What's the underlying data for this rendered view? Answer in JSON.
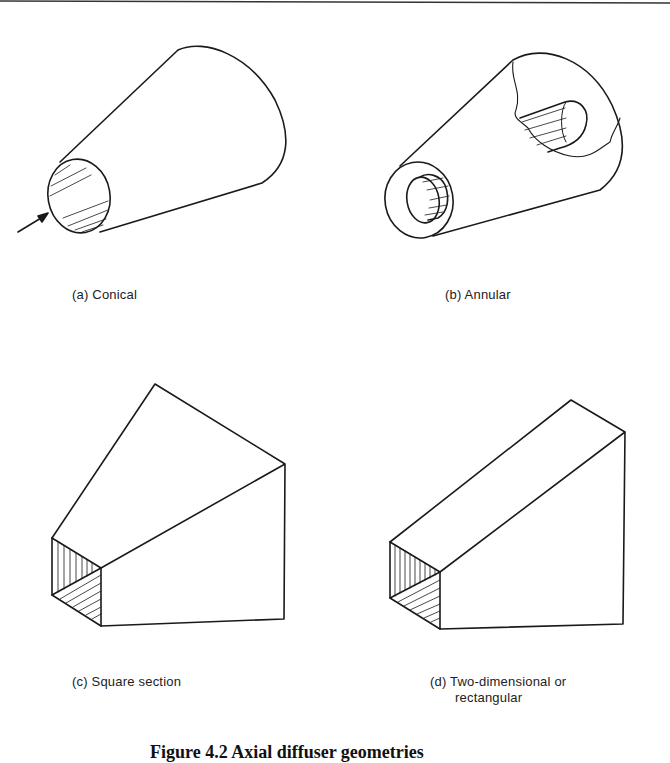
{
  "figure": {
    "panels": [
      {
        "id": "a",
        "label": "(a) Conical",
        "shape": "conical diffuser with inlet flow arrow and hatched inlet"
      },
      {
        "id": "b",
        "label": "(b) Annular",
        "shape": "conical diffuser with inner centerbody, cutaway view"
      },
      {
        "id": "c",
        "label": "(c) Square section",
        "shape": "square-section diffuser, hatched inlet"
      },
      {
        "id": "d",
        "label": "(d) Two-dimensional or rectangular",
        "label_line1": "(d) Two-dimensional or",
        "label_line2": "rectangular",
        "shape": "two-dimensional rectangular diffuser, hatched inlet"
      }
    ],
    "caption": "Figure 4.2  Axial diffuser geometries",
    "colors": {
      "ink": "#1a1a1a",
      "background": "#ffffff"
    }
  }
}
